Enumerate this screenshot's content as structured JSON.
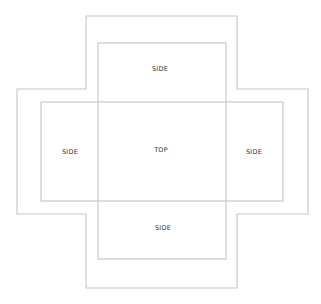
{
  "diagram": {
    "title": "",
    "type": "box-net",
    "line_color": "#c8c8c8",
    "outer_outline": {
      "points": [
        [
          86,
          16
        ],
        [
          237,
          16
        ],
        [
          237,
          89
        ],
        [
          308,
          89
        ],
        [
          308,
          214
        ],
        [
          237,
          214
        ],
        [
          237,
          288
        ],
        [
          86,
          288
        ],
        [
          86,
          214
        ],
        [
          17,
          214
        ],
        [
          17,
          89
        ],
        [
          86,
          89
        ]
      ]
    },
    "panels": {
      "vertical": {
        "x": 98,
        "y": 43,
        "w": 128,
        "h": 216
      },
      "horizontal": {
        "x": 41,
        "y": 102,
        "w": 242,
        "h": 99
      }
    },
    "labels": {
      "top_side": {
        "text": "SIDE",
        "x": 160,
        "y": 69
      },
      "center": {
        "text": "TOP",
        "x": 161,
        "y": 150
      },
      "left_side": {
        "text": "SIDE",
        "x": 70,
        "y": 152
      },
      "right_side": {
        "text": "SIDE",
        "x": 254,
        "y": 152
      },
      "bottom_side": {
        "text": "SIDE",
        "x": 163,
        "y": 228
      }
    }
  }
}
